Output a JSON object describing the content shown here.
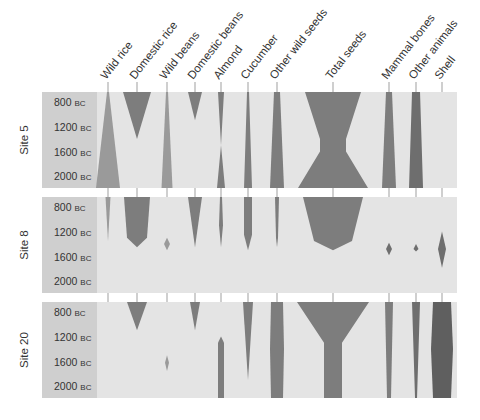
{
  "chart_data": {
    "type": "battleship-curve",
    "title": "",
    "columns": [
      "Wild rice",
      "Domestic rice",
      "Wild beans",
      "Domestic beans",
      "Almond",
      "Cucumber",
      "Other wild seeds",
      "Total seeds",
      "Mammal bones",
      "Other animals",
      "Shell"
    ],
    "column_x": [
      108,
      137,
      167,
      195,
      221,
      248,
      277,
      333,
      389,
      416,
      442
    ],
    "time_ticks": [
      "800",
      "1200",
      "1600",
      "2000"
    ],
    "time_unit": "BC",
    "time_axis": "years BC, 800 at top to 2000 at bottom",
    "sites": [
      {
        "name": "Site 5",
        "shapes": {
          "Wild rice": {
            "widths": [
              [
                800,
                2
              ],
              [
                2000,
                24
              ]
            ],
            "shade": "#9a9a9a"
          },
          "Domestic rice": {
            "widths": [
              [
                800,
                28
              ],
              [
                1400,
                0
              ]
            ],
            "shade": "#7d7d7d"
          },
          "Wild beans": {
            "widths": [
              [
                800,
                2
              ],
              [
                2000,
                11
              ]
            ],
            "shade": "#9a9a9a"
          },
          "Domestic beans": {
            "widths": [
              [
                800,
                14
              ],
              [
                1100,
                0
              ]
            ],
            "shade": "#7d7d7d"
          },
          "Almond": {
            "widths": [
              [
                800,
                6
              ],
              [
                1500,
                0
              ],
              [
                2000,
                8
              ]
            ],
            "shade": "#7d7d7d"
          },
          "Cucumber": {
            "widths": [
              [
                800,
                2
              ],
              [
                2000,
                8
              ]
            ],
            "shade": "#7d7d7d"
          },
          "Other wild seeds": {
            "widths": [
              [
                800,
                6
              ],
              [
                2000,
                14
              ]
            ],
            "shade": "#7d7d7d"
          },
          "Total seeds": {
            "widths": [
              [
                800,
                56
              ],
              [
                1400,
                26
              ],
              [
                1600,
                26
              ],
              [
                2000,
                70
              ]
            ],
            "shade": "#7d7d7d"
          },
          "Mammal bones": {
            "widths": [
              [
                800,
                6
              ],
              [
                2000,
                14
              ]
            ],
            "shade": "#7d7d7d"
          },
          "Other animals": {
            "widths": [
              [
                800,
                8
              ],
              [
                2000,
                14
              ]
            ],
            "shade": "#6e6e6e"
          },
          "Shell": {
            "widths": [],
            "shade": "#6e6e6e"
          }
        }
      },
      {
        "name": "Site 8",
        "shapes": {
          "Wild rice": {
            "widths": [
              [
                800,
                5
              ],
              [
                1350,
                0
              ]
            ],
            "shade": "#9a9a9a"
          },
          "Domestic rice": {
            "widths": [
              [
                800,
                26
              ],
              [
                1300,
                20
              ],
              [
                1450,
                0
              ]
            ],
            "shade": "#7d7d7d"
          },
          "Wild beans": {
            "widths": [
              [
                1300,
                0
              ],
              [
                1400,
                6
              ],
              [
                1500,
                0
              ]
            ],
            "shade": "#9a9a9a"
          },
          "Domestic beans": {
            "widths": [
              [
                800,
                14
              ],
              [
                1450,
                0
              ]
            ],
            "shade": "#7d7d7d"
          },
          "Almond": {
            "widths": [
              [
                800,
                2
              ],
              [
                1100,
                4
              ],
              [
                1450,
                0
              ]
            ],
            "shade": "#7d7d7d"
          },
          "Cucumber": {
            "widths": [
              [
                800,
                8
              ],
              [
                1250,
                8
              ],
              [
                1500,
                0
              ]
            ],
            "shade": "#7d7d7d"
          },
          "Other wild seeds": {
            "widths": [
              [
                800,
                4
              ],
              [
                1300,
                2
              ],
              [
                1450,
                0
              ]
            ],
            "shade": "#7d7d7d"
          },
          "Total seeds": {
            "widths": [
              [
                800,
                60
              ],
              [
                1350,
                38
              ],
              [
                1500,
                0
              ]
            ],
            "shade": "#7d7d7d"
          },
          "Mammal bones": {
            "widths": [
              [
                1380,
                0
              ],
              [
                1480,
                6
              ],
              [
                1580,
                0
              ]
            ],
            "shade": "#6e6e6e"
          },
          "Other animals": {
            "widths": [
              [
                1400,
                0
              ],
              [
                1480,
                5
              ],
              [
                1520,
                0
              ]
            ],
            "shade": "#6e6e6e"
          },
          "Shell": {
            "widths": [
              [
                1200,
                0
              ],
              [
                1480,
                8
              ],
              [
                1780,
                0
              ]
            ],
            "shade": "#6e6e6e"
          }
        }
      },
      {
        "name": "Site 20",
        "shapes": {
          "Wild rice": {
            "widths": [],
            "shade": "#9a9a9a"
          },
          "Domestic rice": {
            "widths": [
              [
                800,
                20
              ],
              [
                1100,
                0
              ]
            ],
            "shade": "#7d7d7d"
          },
          "Wild beans": {
            "widths": [
              [
                1500,
                0
              ],
              [
                1620,
                4
              ],
              [
                1750,
                0
              ]
            ],
            "shade": "#9a9a9a"
          },
          "Domestic beans": {
            "widths": [
              [
                800,
                10
              ],
              [
                1100,
                0
              ]
            ],
            "shade": "#7d7d7d"
          },
          "Almond": {
            "widths": [
              [
                1200,
                0
              ],
              [
                1300,
                6
              ],
              [
                2000,
                6
              ]
            ],
            "shade": "#7d7d7d"
          },
          "Cucumber": {
            "widths": [
              [
                800,
                10
              ],
              [
                1900,
                0
              ]
            ],
            "shade": "#7d7d7d"
          },
          "Other wild seeds": {
            "widths": [
              [
                800,
                12
              ],
              [
                1400,
                14
              ],
              [
                2000,
                12
              ]
            ],
            "shade": "#7d7d7d"
          },
          "Total seeds": {
            "widths": [
              [
                800,
                72
              ],
              [
                1300,
                18
              ],
              [
                2000,
                18
              ]
            ],
            "shade": "#7d7d7d"
          },
          "Mammal bones": {
            "widths": [
              [
                800,
                8
              ],
              [
                2000,
                4
              ]
            ],
            "shade": "#7d7d7d"
          },
          "Other animals": {
            "widths": [
              [
                800,
                8
              ],
              [
                2000,
                2
              ]
            ],
            "shade": "#6e6e6e"
          },
          "Shell": {
            "widths": [
              [
                800,
                18
              ],
              [
                1400,
                22
              ],
              [
                2000,
                18
              ]
            ],
            "shade": "#5f5f5f"
          }
        }
      }
    ],
    "xlabel": "",
    "ylabel": "Date (BC)",
    "grid": false,
    "legend": "none"
  },
  "colors": {
    "panel_bg": "#e4e4e4",
    "label_band_bg": "#cfcfcf",
    "tick_line": "#777777",
    "text": "#333333"
  }
}
